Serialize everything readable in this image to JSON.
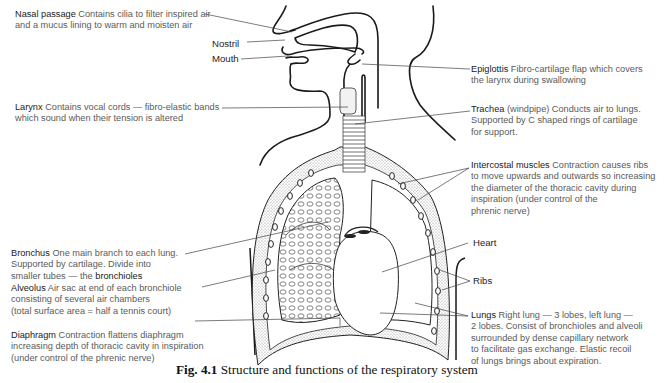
{
  "figure": {
    "caption_number": "Fig. 4.1",
    "caption_text": "Structure and functions of the respiratory system"
  },
  "labels": {
    "nasal_passage": {
      "term": "Nasal passage",
      "lines": [
        "Contains cilia to filter inspired air",
        "and a mucus lining to warm and moisten air"
      ]
    },
    "nostril": {
      "term": "Nostril"
    },
    "mouth": {
      "term": "Mouth"
    },
    "larynx": {
      "term": "Larynx",
      "lines": [
        "Contains vocal cords — fibro-elastic bands",
        "which sound when their tension is altered"
      ]
    },
    "bronchus": {
      "term": "Bronchus",
      "lines": [
        "One main branch to each lung.",
        "Supported by cartilage. Divide into",
        "smaller tubes — the "
      ],
      "emphasis": "bronchioles"
    },
    "alveolus": {
      "term": "Alveolus",
      "lines": [
        "Air sac at end of each bronchiole",
        "consisting of several air chambers",
        "(total surface area = half a tennis court)"
      ]
    },
    "diaphragm": {
      "term": "Diaphragm",
      "lines": [
        "Contraction flattens diaphragm",
        "increasing depth of thoracic cavity in inspiration",
        "(under control of the phrenic nerve)"
      ]
    },
    "epiglottis": {
      "term": "Epiglottis",
      "lines": [
        "Fibro-cartilage flap which covers",
        "the larynx during swallowing"
      ]
    },
    "trachea": {
      "term": "Trachea",
      "lines": [
        "(windpipe) Conducts air to lungs.",
        "Supported by C shaped rings of cartilage",
        "for support."
      ]
    },
    "intercostal": {
      "term": "Intercostal muscles",
      "lines": [
        "Contraction causes ribs",
        "to move upwards and outwards so increasing",
        "the diameter of the thoracic cavity during",
        "inspiration (under control of the",
        "phrenic nerve)"
      ]
    },
    "heart": {
      "term": "Heart"
    },
    "ribs": {
      "term": "Ribs"
    },
    "lungs": {
      "term": "Lungs",
      "lines": [
        "Right lung — 3 lobes, left lung —",
        "2 lobes. Consist of bronchioles and alveoli",
        "surrounded by dense capillary network",
        "to facilitate gas exchange. Elastic recoil",
        "of lungs brings about expiration."
      ]
    }
  },
  "colors": {
    "ink": "#1a1a1a",
    "label_text": "#5a5a5a",
    "stipple": "#b8b8b8",
    "background": "#ffffff"
  }
}
